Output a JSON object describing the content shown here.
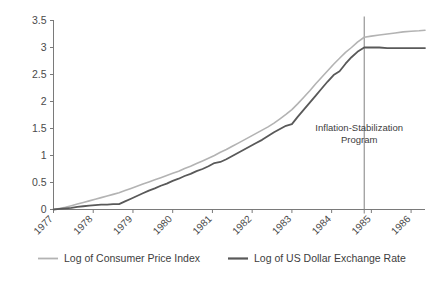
{
  "chart_data": {
    "type": "line",
    "title": "",
    "xlabel": "",
    "ylabel": "",
    "xlim": [
      1977.0,
      1986.35
    ],
    "ylim": [
      0,
      3.5
    ],
    "grid": false,
    "legend_position": "bottom",
    "y_ticks": [
      "0",
      "0.5",
      "1",
      "1.5",
      "2",
      "2.5",
      "3",
      "3.5"
    ],
    "y_tick_values": [
      0,
      0.5,
      1,
      1.5,
      2,
      2.5,
      3,
      3.5
    ],
    "x_ticks": [
      "1977",
      "1978",
      "1979",
      "1980",
      "1981",
      "1982",
      "1983",
      "1984",
      "1985",
      "1986"
    ],
    "x_tick_values": [
      1977,
      1978,
      1979,
      1980,
      1981,
      1982,
      1983,
      1984,
      1985,
      1986
    ],
    "annotations": [
      {
        "name": "inflation-stabilization-marker",
        "text_line1": "Inflation-Stabilization",
        "text_line2": "Program",
        "x_value": 1984.82,
        "type": "vertical-line-with-label"
      }
    ],
    "series": [
      {
        "name": "Log of Consumer Price Index",
        "color": "#b3b3b3",
        "x": [
          1977.0,
          1977.15,
          1977.3,
          1977.45,
          1977.6,
          1977.75,
          1977.9,
          1978.05,
          1978.2,
          1978.35,
          1978.5,
          1978.65,
          1978.8,
          1978.95,
          1979.1,
          1979.25,
          1979.4,
          1979.55,
          1979.7,
          1979.85,
          1980.0,
          1980.15,
          1980.3,
          1980.45,
          1980.6,
          1980.75,
          1980.9,
          1981.05,
          1981.2,
          1981.35,
          1981.5,
          1981.65,
          1981.8,
          1981.95,
          1982.1,
          1982.25,
          1982.4,
          1982.55,
          1982.7,
          1982.85,
          1983.0,
          1983.15,
          1983.3,
          1983.45,
          1983.6,
          1983.75,
          1983.9,
          1984.05,
          1984.2,
          1984.35,
          1984.5,
          1984.65,
          1984.82,
          1985.0,
          1985.2,
          1985.4,
          1985.6,
          1985.8,
          1986.0,
          1986.2,
          1986.35
        ],
        "y": [
          0.0,
          0.02,
          0.04,
          0.07,
          0.1,
          0.13,
          0.16,
          0.19,
          0.22,
          0.25,
          0.28,
          0.31,
          0.35,
          0.39,
          0.43,
          0.47,
          0.51,
          0.55,
          0.59,
          0.63,
          0.67,
          0.71,
          0.76,
          0.8,
          0.85,
          0.9,
          0.95,
          1.0,
          1.06,
          1.11,
          1.17,
          1.23,
          1.29,
          1.35,
          1.41,
          1.47,
          1.53,
          1.6,
          1.68,
          1.76,
          1.85,
          1.96,
          2.08,
          2.2,
          2.33,
          2.45,
          2.57,
          2.69,
          2.8,
          2.91,
          3.0,
          3.1,
          3.19,
          3.21,
          3.23,
          3.25,
          3.27,
          3.29,
          3.3,
          3.31,
          3.32
        ]
      },
      {
        "name": "Log of US Dollar Exchange Rate",
        "color": "#595959",
        "x": [
          1977.0,
          1977.15,
          1977.3,
          1977.45,
          1977.6,
          1977.75,
          1977.9,
          1978.05,
          1978.2,
          1978.35,
          1978.5,
          1978.65,
          1978.8,
          1978.95,
          1979.1,
          1979.25,
          1979.4,
          1979.55,
          1979.7,
          1979.85,
          1980.0,
          1980.15,
          1980.3,
          1980.45,
          1980.6,
          1980.75,
          1980.9,
          1981.05,
          1981.2,
          1981.35,
          1981.5,
          1981.65,
          1981.8,
          1981.95,
          1982.1,
          1982.25,
          1982.4,
          1982.55,
          1982.7,
          1982.85,
          1983.0,
          1983.15,
          1983.3,
          1983.45,
          1983.6,
          1983.75,
          1983.9,
          1984.05,
          1984.2,
          1984.35,
          1984.5,
          1984.65,
          1984.82,
          1985.0,
          1985.2,
          1985.4,
          1985.6,
          1985.8,
          1986.0,
          1986.2,
          1986.35
        ],
        "y": [
          0.0,
          0.01,
          0.02,
          0.03,
          0.05,
          0.06,
          0.07,
          0.08,
          0.09,
          0.09,
          0.1,
          0.1,
          0.15,
          0.2,
          0.25,
          0.3,
          0.35,
          0.39,
          0.44,
          0.48,
          0.53,
          0.57,
          0.62,
          0.66,
          0.71,
          0.75,
          0.8,
          0.86,
          0.88,
          0.93,
          0.99,
          1.05,
          1.11,
          1.17,
          1.23,
          1.29,
          1.36,
          1.43,
          1.49,
          1.55,
          1.58,
          1.72,
          1.85,
          1.98,
          2.11,
          2.24,
          2.37,
          2.49,
          2.56,
          2.7,
          2.82,
          2.92,
          3.0,
          3.0,
          3.0,
          2.99,
          2.99,
          2.99,
          2.99,
          2.99,
          2.99
        ]
      }
    ]
  },
  "legend": {
    "items": [
      {
        "label": "Log of Consumer Price Index",
        "color": "#b3b3b3"
      },
      {
        "label": "Log of US Dollar Exchange Rate",
        "color": "#595959"
      }
    ]
  },
  "axes": {
    "axis_color": "#7a7a7a",
    "tick_color": "#7a7a7a"
  }
}
